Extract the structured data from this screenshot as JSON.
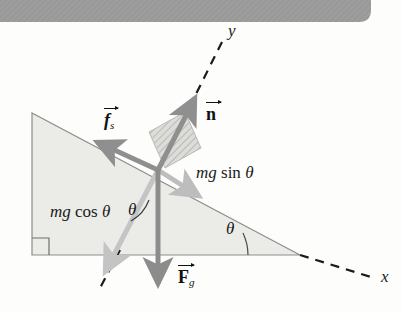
{
  "figure": {
    "background_color": "#fdfdfc",
    "banner": {
      "color": "#9a9a9a",
      "x": 0,
      "y": 0,
      "width": 371,
      "height": 22
    }
  },
  "incline": {
    "fill_color": "#ebebe8",
    "stroke_color": "#8d8d8d",
    "apex_top": {
      "x": 32,
      "y": 113
    },
    "corner_bottom_left": {
      "x": 32,
      "y": 255
    },
    "corner_bottom_right": {
      "x": 300,
      "y": 255
    },
    "right_angle_marker": true
  },
  "block": {
    "name": "block-on-incline",
    "fill_color": "#dadad6",
    "hatch_color": "#b4b4b0"
  },
  "axes": {
    "style": "dashed",
    "color": "#1b1b1b",
    "x_label": "x",
    "y_label": "y",
    "x_label_pos": {
      "x": 381,
      "y": 278
    },
    "y_label_pos": {
      "x": 228,
      "y": 30
    }
  },
  "vectors": [
    {
      "id": "normal-force",
      "label": "n",
      "subscript": "",
      "color": "#8f8f8f",
      "label_pos": {
        "x": 206,
        "y": 112
      },
      "description": "Normal force, perpendicular to incline, up-right along +y"
    },
    {
      "id": "static-friction",
      "label": "f",
      "subscript": "s",
      "color": "#8f8f8f",
      "label_pos": {
        "x": 104,
        "y": 118
      },
      "description": "Static friction force, up the incline toward upper-left"
    },
    {
      "id": "gravitational-force",
      "label": "F",
      "subscript": "g",
      "color": "#8c8c8c",
      "label_pos": {
        "x": 178,
        "y": 276
      },
      "description": "Gravitational force, straight down"
    }
  ],
  "components": [
    {
      "id": "mg-sin-theta",
      "text_italic": "mg",
      "text_roman": " sin ",
      "text_theta": "θ",
      "color": "#bdbdbd",
      "label_pos": {
        "x": 196,
        "y": 172
      },
      "description": "Component of gravity along the incline, pointing down-slope"
    },
    {
      "id": "mg-cos-theta",
      "text_italic": "mg",
      "text_roman": " cos ",
      "text_theta": "θ",
      "color": "#c4c4c4",
      "label_pos": {
        "x": 50,
        "y": 211
      },
      "description": "Component of gravity perpendicular into the incline, down-left"
    }
  ],
  "angles": [
    {
      "id": "theta-at-vertex",
      "label": "θ",
      "label_pos": {
        "x": 230,
        "y": 228
      },
      "description": "Incline angle at the base vertex between horizontal base and incline surface"
    },
    {
      "id": "theta-at-block",
      "label": "θ",
      "label_pos": {
        "x": 130,
        "y": 209
      },
      "description": "Angle between gravity vector and the perpendicular component"
    }
  ]
}
